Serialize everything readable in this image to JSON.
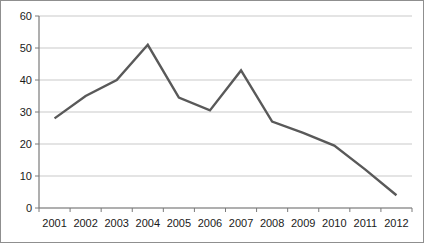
{
  "chart_data": {
    "type": "line",
    "title": "",
    "subtitle": "",
    "xlabel": "",
    "ylabel": "",
    "categories": [
      "2001",
      "2002",
      "2003",
      "2004",
      "2005",
      "2006",
      "2007",
      "2008",
      "2009",
      "2010",
      "2011",
      "2012"
    ],
    "values": [
      28,
      35,
      40,
      51,
      34.5,
      30.5,
      43,
      27,
      23.5,
      19.5,
      12,
      4
    ],
    "series": [
      {
        "name": "",
        "values": [
          28,
          35,
          40,
          51,
          34.5,
          30.5,
          43,
          27,
          23.5,
          19.5,
          12,
          4
        ]
      }
    ],
    "ylim": [
      0,
      60
    ],
    "yticks": [
      0,
      10,
      20,
      30,
      40,
      50,
      60
    ],
    "ytick_labels": [
      "0",
      "10",
      "20",
      "30",
      "40",
      "50",
      "60"
    ],
    "xtick_labels": [
      "2001",
      "2002",
      "2003",
      "2004",
      "2005",
      "2006",
      "2007",
      "2008",
      "2009",
      "2010",
      "2011",
      "2012"
    ],
    "grid": "horizontal",
    "legend": "none",
    "colors": {
      "line": "#595959",
      "gridline": "#c9c9c9",
      "axis": "#7a7a7a",
      "frame": "#8f8f8f",
      "text": "#1a1a1a",
      "background": "#ffffff"
    },
    "line_width": 2.4,
    "markers": "none"
  }
}
